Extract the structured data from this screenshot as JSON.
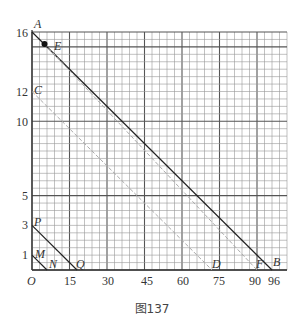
{
  "caption": "图137",
  "chart_data": {
    "type": "line",
    "title": "",
    "xlabel": "",
    "ylabel": "",
    "origin_label": "O",
    "x_ticks": [
      15,
      30,
      45,
      60,
      75,
      90,
      96
    ],
    "y_ticks": [
      1,
      3,
      5,
      10,
      12,
      16
    ],
    "xlim": [
      0,
      100
    ],
    "ylim": [
      0,
      16
    ],
    "grid": true,
    "points": {
      "A": [
        0,
        16
      ],
      "B": [
        96,
        0
      ],
      "C": [
        0,
        12
      ],
      "D": [
        72,
        0
      ],
      "E": [
        5,
        15.2
      ],
      "F": [
        90,
        0
      ],
      "M": [
        0,
        1
      ],
      "N": [
        6,
        0
      ],
      "P": [
        0,
        3
      ],
      "Q": [
        18,
        0
      ]
    },
    "segments": [
      {
        "name": "AB",
        "from": "A",
        "to": "B",
        "style": "solid"
      },
      {
        "name": "CD",
        "from": "C",
        "to": "D",
        "style": "dashed"
      },
      {
        "name": "EF",
        "from": "E",
        "to": "F",
        "style": "dashed"
      },
      {
        "name": "MN",
        "from": "M",
        "to": "N",
        "style": "solid"
      },
      {
        "name": "PQ",
        "from": "P",
        "to": "Q",
        "style": "solid"
      }
    ],
    "highlighted_point": "E"
  },
  "labels": {
    "origin": "O",
    "x": [
      "15",
      "30",
      "45",
      "60",
      "75",
      "90",
      "96"
    ],
    "y": [
      "1",
      "3",
      "5",
      "10",
      "12",
      "16"
    ],
    "A": "A",
    "B": "B",
    "C": "C",
    "D": "D",
    "E": "E",
    "F": "F",
    "M": "M",
    "N": "N",
    "P": "P",
    "Q": "Q"
  }
}
